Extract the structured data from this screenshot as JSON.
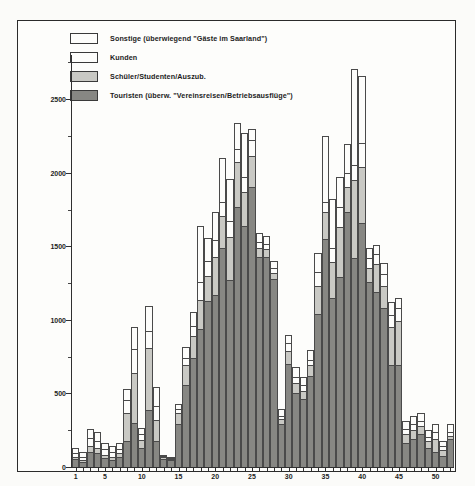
{
  "chart_data": {
    "type": "bar",
    "stacked": true,
    "title": "",
    "subtitle": "",
    "xlabel": "",
    "ylabel": "",
    "ylim": [
      0,
      2800
    ],
    "yticks": [
      0,
      500,
      1000,
      1500,
      2000,
      2500
    ],
    "ytick_labels": [
      "0",
      "500",
      "1000",
      "1500",
      "2000",
      "2500"
    ],
    "grid": false,
    "legend_position": "top-left",
    "x": [
      1,
      2,
      3,
      4,
      5,
      6,
      7,
      8,
      9,
      10,
      11,
      12,
      13,
      14,
      15,
      16,
      17,
      18,
      19,
      20,
      21,
      22,
      23,
      24,
      25,
      26,
      27,
      28,
      29,
      30,
      31,
      32,
      33,
      34,
      35,
      36,
      37,
      38,
      39,
      40,
      41,
      42,
      43,
      44,
      45,
      46,
      47,
      48,
      49,
      50,
      51,
      52
    ],
    "xtick_labels": [
      "1",
      "5",
      "10",
      "15",
      "20",
      "25",
      "30",
      "35",
      "40",
      "45",
      "50"
    ],
    "xticks": [
      1,
      5,
      10,
      15,
      20,
      25,
      30,
      35,
      40,
      45,
      50
    ],
    "series": [
      {
        "name": "Touristen (überw. \"Vereinsreisen/Betriebsausflüge\")",
        "color": "#878783",
        "pattern": "solid-dark",
        "values": [
          55,
          35,
          100,
          95,
          60,
          50,
          70,
          175,
          300,
          130,
          390,
          180,
          55,
          45,
          290,
          560,
          740,
          935,
          1130,
          1170,
          1490,
          1270,
          1770,
          1640,
          1900,
          1430,
          1430,
          1275,
          290,
          700,
          500,
          460,
          620,
          1040,
          1550,
          1150,
          1290,
          1730,
          1420,
          1660,
          1260,
          1190,
          1080,
          690,
          690,
          165,
          190,
          225,
          130,
          105,
          75,
          190
        ]
      },
      {
        "name": "Schüler/Studenten/Auszub.",
        "color": "#c9c9c4",
        "pattern": "mid-stipple",
        "values": [
          15,
          15,
          40,
          35,
          25,
          20,
          25,
          190,
          340,
          55,
          420,
          140,
          10,
          5,
          80,
          130,
          150,
          200,
          170,
          255,
          215,
          290,
          300,
          230,
          215,
          60,
          50,
          45,
          35,
          90,
          70,
          55,
          70,
          190,
          180,
          240,
          340,
          175,
          530,
          380,
          95,
          190,
          150,
          260,
          300,
          60,
          60,
          55,
          45,
          85,
          40,
          20
        ]
      },
      {
        "name": "Kunden",
        "color": "#fdfdfb",
        "pattern": "plain",
        "values": [
          25,
          20,
          55,
          45,
          35,
          30,
          30,
          90,
          165,
          40,
          115,
          95,
          5,
          5,
          25,
          50,
          70,
          120,
          100,
          120,
          95,
          110,
          90,
          100,
          105,
          40,
          35,
          30,
          25,
          55,
          45,
          40,
          40,
          95,
          70,
          100,
          140,
          90,
          105,
          160,
          65,
          70,
          80,
          85,
          90,
          35,
          40,
          35,
          30,
          45,
          25,
          25
        ]
      },
      {
        "name": "Sonstige (überwiegend \"Gäste im Saarland\")",
        "color": "#fdfdfb",
        "pattern": "dotted-light",
        "values": [
          35,
          30,
          65,
          60,
          45,
          40,
          40,
          75,
          145,
          40,
          170,
          130,
          10,
          10,
          35,
          75,
          95,
          380,
          160,
          190,
          300,
          290,
          180,
          300,
          80,
          60,
          55,
          50,
          45,
          55,
          65,
          60,
          65,
          130,
          450,
          330,
          200,
          200,
          650,
          460,
          70,
          60,
          75,
          85,
          70,
          55,
          55,
          50,
          45,
          55,
          40,
          60
        ]
      }
    ]
  },
  "legend": {
    "items": [
      {
        "label": "Sonstige (überwiegend \"Gäste im Saarland\")",
        "pattern": "dotted-light"
      },
      {
        "label": "Kunden",
        "pattern": "plain"
      },
      {
        "label": "Schüler/Studenten/Auszub.",
        "pattern": "mid-stipple"
      },
      {
        "label": "Touristen (überw. \"Vereinsreisen/Betriebsausflüge\")",
        "pattern": "solid-dark"
      }
    ]
  }
}
